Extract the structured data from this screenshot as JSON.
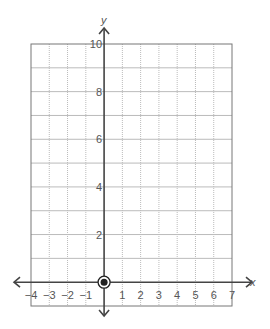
{
  "chart_data": {
    "type": "scatter",
    "title": "",
    "xlabel": "x",
    "ylabel": "y",
    "xlim": [
      -4,
      7
    ],
    "ylim": [
      -1,
      10
    ],
    "grid": true,
    "x_ticks": [
      -4,
      -3,
      -2,
      -1,
      1,
      2,
      3,
      4,
      5,
      6,
      7
    ],
    "x_tick_labels": [
      "−4",
      "−3",
      "−2",
      "−1",
      "1",
      "2",
      "3",
      "4",
      "5",
      "6",
      "7"
    ],
    "y_ticks": [
      2,
      4,
      6,
      8,
      10
    ],
    "y_tick_labels": [
      "2",
      "4",
      "6",
      "8",
      "10"
    ],
    "points": [
      {
        "x": 0,
        "y": 0,
        "style": "closed-circle-ring"
      }
    ],
    "colors": {
      "axis": "#444444",
      "grid": "#bbbbbb",
      "border": "#777777",
      "point": "#222222"
    }
  }
}
